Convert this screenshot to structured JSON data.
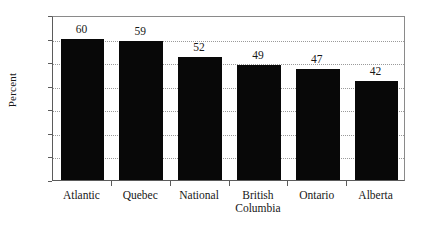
{
  "chart_data": {
    "type": "bar",
    "title": "",
    "xlabel": "",
    "ylabel": "Percent",
    "categories": [
      "Atlantic",
      "Quebec",
      "National",
      "British Columbia",
      "Ontario",
      "Alberta"
    ],
    "category_lines": [
      [
        "Atlantic"
      ],
      [
        "Quebec"
      ],
      [
        "National"
      ],
      [
        "British",
        "Columbia"
      ],
      [
        "Ontario"
      ],
      [
        "Alberta"
      ]
    ],
    "values": [
      60,
      59,
      52,
      49,
      47,
      42
    ],
    "value_labels": [
      "60",
      "59",
      "52",
      "49",
      "47",
      "42"
    ],
    "ylim": [
      0,
      70
    ],
    "ytick_values": [
      70,
      60,
      50,
      40,
      30,
      20,
      10,
      0
    ],
    "ytick_labels": [
      "70",
      "60",
      "50",
      "40",
      "30",
      "20",
      "10",
      "0"
    ],
    "ystep": 10,
    "grid": true,
    "grid_style": "dotted",
    "grid_color": "#9a9a9a",
    "legend": false,
    "bar_color": "#080808",
    "axis_color": "#5b5b5b",
    "background_color": "#ffffff",
    "text_color": "#171717"
  }
}
